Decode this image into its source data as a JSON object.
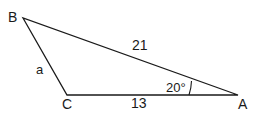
{
  "diagram": {
    "type": "triangle",
    "vertices": {
      "A": {
        "label": "A"
      },
      "B": {
        "label": "B"
      },
      "C": {
        "label": "C"
      }
    },
    "sides": {
      "BC": {
        "label": "a"
      },
      "AB": {
        "label": "21"
      },
      "CA": {
        "label": "13"
      }
    },
    "angle_A": {
      "label": "20°"
    },
    "colors": {
      "stroke": "#1a1a1a",
      "background": "#ffffff"
    }
  }
}
